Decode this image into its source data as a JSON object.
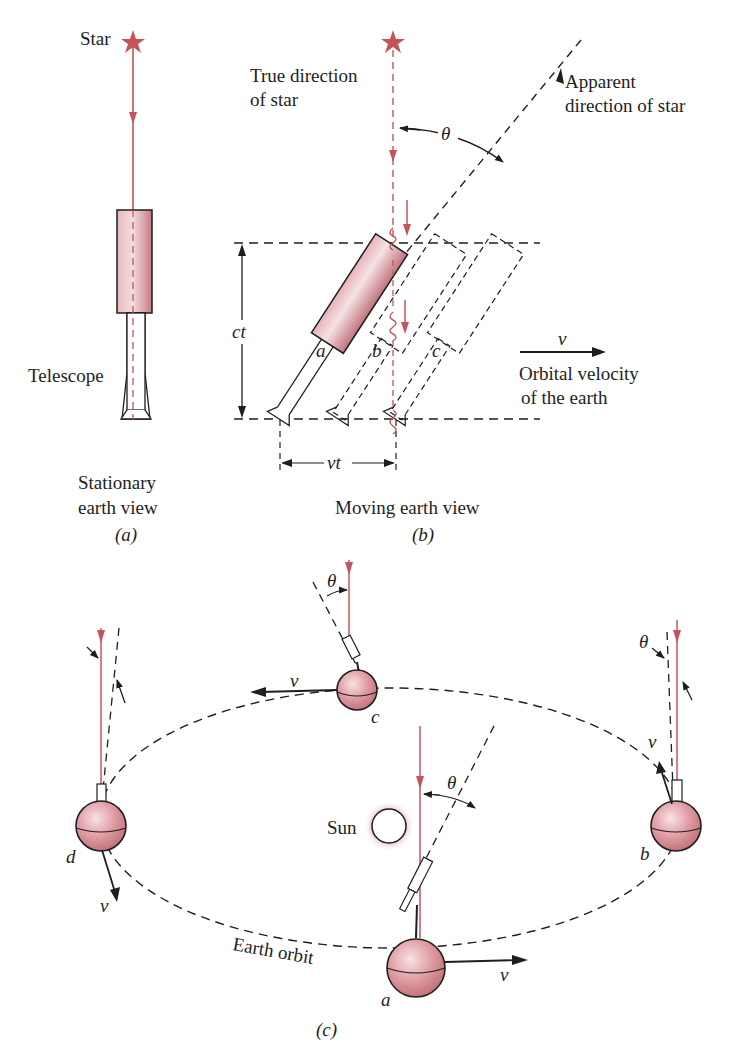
{
  "colors": {
    "light_ray": "#c4545a",
    "telescope_fill_dark": "#c98088",
    "telescope_fill_light": "#f6e4e6",
    "earth_fill": "#d98a90",
    "ink": "#1e1e1e",
    "sun_glow": "#d9a0a4"
  },
  "panel_a": {
    "star_label": "Star",
    "telescope_label": "Telescope",
    "caption_line1": "Stationary",
    "caption_line2": "earth view",
    "panel_label": "(a)"
  },
  "panel_b": {
    "true_direction_line1": "True direction",
    "true_direction_line2": "of star",
    "apparent_direction_line1": "Apparent",
    "apparent_direction_line2": "direction of star",
    "angle_symbol": "θ",
    "height_label": "ct",
    "width_label": "vt",
    "position_labels": [
      "a",
      "b",
      "c"
    ],
    "velocity_symbol": "v",
    "velocity_line1": "Orbital velocity",
    "velocity_line2": "of the earth",
    "caption": "Moving earth view",
    "panel_label": "(b)"
  },
  "panel_c": {
    "sun_label": "Sun",
    "orbit_label": "Earth orbit",
    "angle_symbol": "θ",
    "velocity_symbol": "v",
    "earth_positions": [
      {
        "id": "a",
        "label": "a"
      },
      {
        "id": "b",
        "label": "b"
      },
      {
        "id": "c",
        "label": "c"
      },
      {
        "id": "d",
        "label": "d"
      }
    ],
    "panel_label": "(c)"
  }
}
